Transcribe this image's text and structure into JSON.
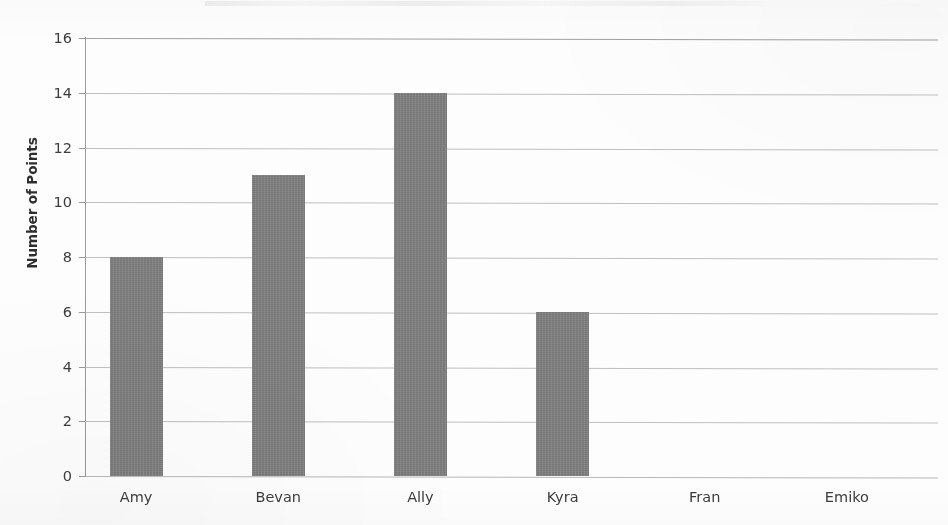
{
  "chart_data": {
    "type": "bar",
    "title": "",
    "xlabel": "",
    "ylabel": "Number of Points",
    "categories": [
      "Amy",
      "Bevan",
      "Ally",
      "Kyra",
      "Fran",
      "Emiko"
    ],
    "values": [
      8,
      11,
      14,
      6,
      0,
      0
    ],
    "ylim": [
      0,
      16
    ],
    "ytick_step": 2,
    "yticks": [
      16,
      14,
      12,
      10,
      8,
      6,
      4,
      2,
      0
    ],
    "ytick_labels": [
      "16",
      "14",
      "12",
      "10",
      "8",
      "6",
      "4",
      "2",
      "0"
    ],
    "grid": true,
    "legend": "none",
    "bar_color": "#7f7f7f",
    "gridline_color": "#a8a8ac",
    "axis_color": "#9a9a9a",
    "text_color": "#3c3c3c"
  },
  "axes": {
    "y_title": "Number of Points"
  }
}
